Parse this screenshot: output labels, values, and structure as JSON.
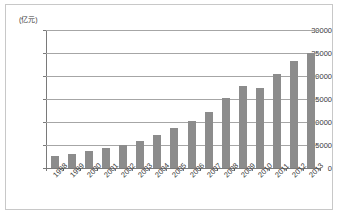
{
  "chart_data": {
    "type": "bar",
    "title": "",
    "subtitle": "",
    "xlabel": "",
    "ylabel": "",
    "unit_label": "(亿元)",
    "categories": [
      "1998",
      "1999",
      "2000",
      "2001",
      "2002",
      "2003",
      "2004",
      "2005",
      "2006",
      "2007",
      "2008",
      "2009",
      "2010",
      "2011",
      "2012",
      "2013"
    ],
    "values": [
      2700,
      3100,
      3700,
      4300,
      4900,
      5800,
      7200,
      8700,
      10200,
      12200,
      15200,
      17800,
      17300,
      20400,
      23200,
      25100
    ],
    "series": [
      {
        "name": "",
        "values": [
          2700,
          3100,
          3700,
          4300,
          4900,
          5800,
          7200,
          8700,
          10200,
          12200,
          15200,
          17800,
          17300,
          20400,
          23200,
          25100
        ]
      }
    ],
    "ylim": [
      0,
      30000
    ],
    "yticks": [
      0,
      5000,
      10000,
      15000,
      20000,
      25000,
      30000
    ],
    "ytick_labels": [
      "0",
      "5000",
      "10000",
      "15000",
      "20000",
      "25000",
      "30000"
    ],
    "grid": true,
    "grid_axis": "y",
    "legend": false,
    "legend_position": "none",
    "bar_color": "#8c8c8c",
    "gridline_color": "#a6a6a6",
    "axis_color": "#7a7a7a",
    "border_color": "#c8c8c8",
    "background_color": "#ffffff",
    "xtick_label_rotation": -45
  }
}
